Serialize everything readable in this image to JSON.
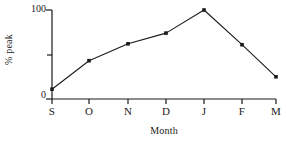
{
  "chart_data": {
    "type": "line",
    "title": "",
    "subtitle": "",
    "xlabel": "Month",
    "ylabel": "% peak",
    "categories": [
      "S",
      "O",
      "N",
      "D",
      "J",
      "F",
      "M"
    ],
    "values": [
      11,
      43,
      62,
      74,
      100,
      61,
      25
    ],
    "series": [
      {
        "name": "% peak",
        "values": [
          11,
          43,
          62,
          74,
          100,
          61,
          25
        ]
      }
    ],
    "ylim": [
      0,
      100
    ],
    "ytick_labels": [
      "0",
      "100"
    ],
    "ytick_values": [
      0,
      100
    ],
    "ytick_minor_values": [
      50
    ],
    "xtick_labels": [
      "S",
      "O",
      "N",
      "D",
      "J",
      "F",
      "M"
    ],
    "grid": false,
    "legend": false,
    "legend_position": "none",
    "marker": "filled-square",
    "line_color": "#1a1a1a",
    "marker_color": "#1a1a1a",
    "axis_color": "#1a1a1a",
    "background_color": "#ffffff",
    "annotations": []
  },
  "axes": {
    "y": {
      "label": "% peak",
      "top_tick_label": "100",
      "bottom_tick_label": "0"
    },
    "x": {
      "label": "Month",
      "ticks": [
        {
          "label": "S",
          "value": 11
        },
        {
          "label": "O",
          "value": 43
        },
        {
          "label": "N",
          "value": 62
        },
        {
          "label": "D",
          "value": 74
        },
        {
          "label": "J",
          "value": 100
        },
        {
          "label": "F",
          "value": 61
        },
        {
          "label": "M",
          "value": 25
        }
      ]
    }
  }
}
